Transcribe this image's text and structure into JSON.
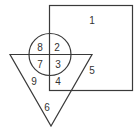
{
  "diagram": {
    "type": "venn-shapes",
    "shapes": [
      "square",
      "circle",
      "triangle"
    ],
    "stroke_color": "#3a3a3a",
    "regions": [
      {
        "id": "r1",
        "label": "1",
        "x": 92,
        "y": 21
      },
      {
        "id": "r2",
        "label": "2",
        "x": 57,
        "y": 48
      },
      {
        "id": "r3",
        "label": "3",
        "x": 58,
        "y": 65
      },
      {
        "id": "r4",
        "label": "4",
        "x": 58,
        "y": 82
      },
      {
        "id": "r5",
        "label": "5",
        "x": 92,
        "y": 71
      },
      {
        "id": "r6",
        "label": "6",
        "x": 47,
        "y": 108
      },
      {
        "id": "r7",
        "label": "7",
        "x": 40,
        "y": 65
      },
      {
        "id": "r8",
        "label": "8",
        "x": 40,
        "y": 48
      },
      {
        "id": "r9",
        "label": "9",
        "x": 34,
        "y": 82
      }
    ]
  }
}
